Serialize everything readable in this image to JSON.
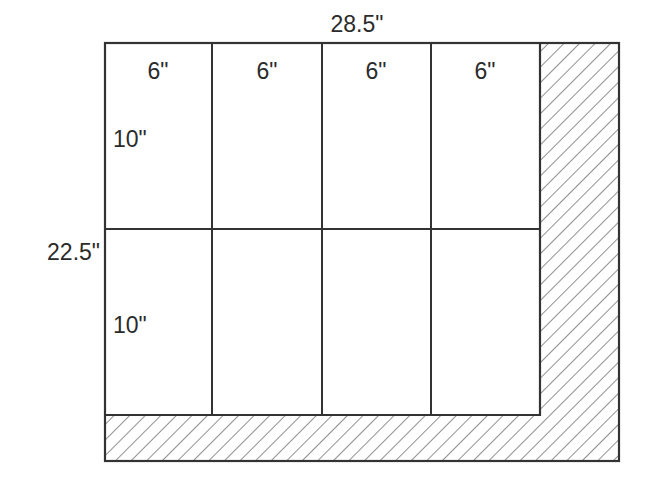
{
  "diagram": {
    "overall_width_label": "28.5\"",
    "overall_height_label": "22.5\"",
    "column_labels": [
      "6\"",
      "6\"",
      "6\"",
      "6\""
    ],
    "row_labels": [
      "10\"",
      "10\""
    ],
    "grid": {
      "columns": 4,
      "rows": 2
    },
    "hatched_region": "L-shaped waste area along right edge and bottom",
    "colors": {
      "line": "#333333",
      "hatch": "#555555",
      "background": "#ffffff"
    }
  }
}
